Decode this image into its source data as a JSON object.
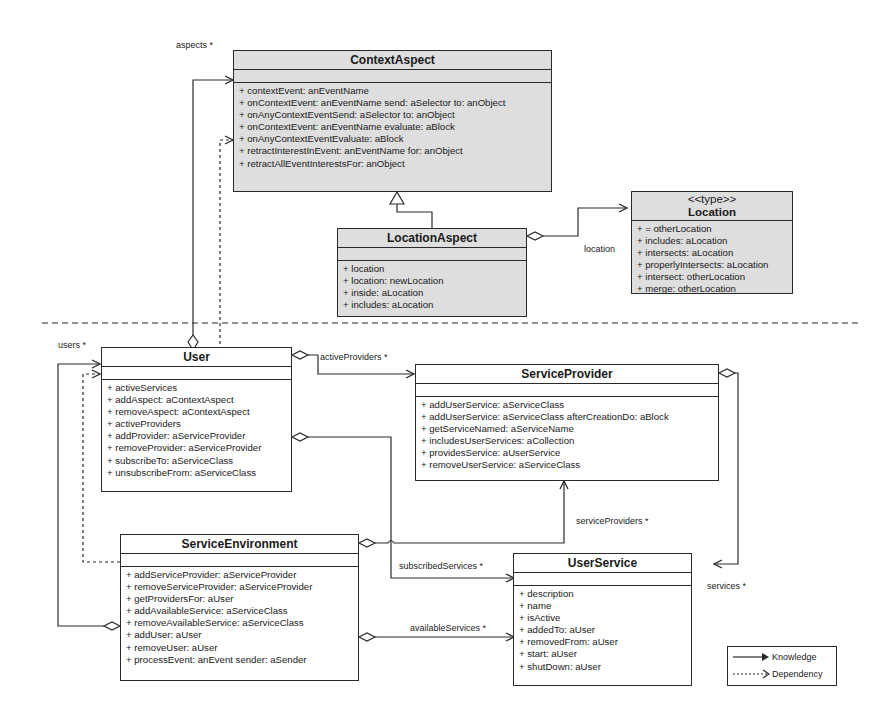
{
  "diagram": {
    "type": "UML class diagram",
    "classes": {
      "context_aspect": {
        "name": "ContextAspect",
        "operations": [
          "+ contextEvent: anEventName",
          "+ onContextEvent: anEventName send: aSelector to: anObject",
          "+ onAnyContextEventSend: aSelector to: anObject",
          "+ onContextEvent: anEventName evaluate: aBlock",
          "+ onAnyContextEventEvaluate: aBlock",
          "+ retractInterestInEvent: anEventName for: anObject",
          "+ retractAllEventInterestsFor: anObject"
        ]
      },
      "location_aspect": {
        "name": "LocationAspect",
        "operations": [
          "+ location",
          "+ location: newLocation",
          "+ inside: aLocation",
          "+ includes: aLocation"
        ]
      },
      "location": {
        "stereotype": "<<type>>",
        "name": "Location",
        "operations": [
          "+ = otherLocation",
          "+ includes: aLocation",
          "+ intersects: aLocation",
          "+ properlyIntersects: aLocation",
          "+ intersect: otherLocation",
          "+ merge: otherLocation"
        ]
      },
      "user": {
        "name": "User",
        "operations": [
          "+ activeServices",
          "+ addAspect: aContextAspect",
          "+ removeAspect: aContextAspect",
          "+ activeProviders",
          "+ addProvider: aServiceProvider",
          "+ removeProvider: aServiceProvider",
          "+ subscribeTo: aServiceClass",
          "+ unsubscribeFrom: aServiceClass"
        ]
      },
      "service_provider": {
        "name": "ServiceProvider",
        "operations": [
          "+ addUserService: aServiceClass",
          "+ addUserService: aServiceClass afterCreationDo: aBlock",
          "+ getServiceNamed: aServiceName",
          "+ includesUserServices: aCollection",
          "+ providesService: aUserService",
          "+ removeUserService: aServiceClass"
        ]
      },
      "service_environment": {
        "name": "ServiceEnvironment",
        "operations": [
          "+ addServiceProvider: aServiceProvider",
          "+ removeServiceProvider: aServiceProvider",
          "+ getProvidersFor: aUser",
          "+ addAvailableService: aServiceClass",
          "+ removeAvailableService: aServiceClass",
          "+ addUser: aUser",
          "+ removeUser: aUser",
          "+ processEvent: anEvent sender: aSender"
        ]
      },
      "user_service": {
        "name": "UserService",
        "operations": [
          "+ description",
          "+ name",
          "+ isActive",
          "+ addedTo: aUser",
          "+ removedFrom: aUser",
          "+ start: aUser",
          "+ shutDown: aUser"
        ]
      }
    },
    "relationships": {
      "aspects": "aspects *",
      "location": "location",
      "users": "users *",
      "active_providers": "activeProviders *",
      "service_providers": "serviceProviders *",
      "subscribed_services": "subscribedServices *",
      "services": "services *",
      "available_services": "availableServices *"
    },
    "legend": {
      "knowledge": "Knowledge",
      "dependency": "Dependency"
    }
  }
}
